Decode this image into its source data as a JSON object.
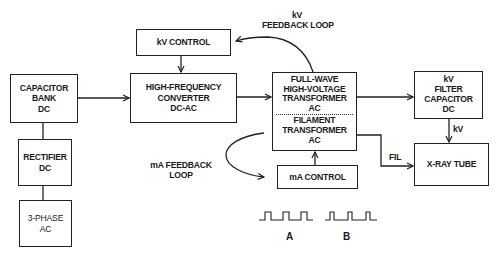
{
  "diagram": {
    "blocks": {
      "capacitor_bank": {
        "lines": [
          "CAPACITOR",
          "BANK",
          "DC"
        ]
      },
      "rectifier": {
        "lines": [
          "RECTIFIER",
          "DC"
        ]
      },
      "three_phase": {
        "lines": [
          "3-PHASE",
          "AC"
        ]
      },
      "kv_control": {
        "lines": [
          "kV CONTROL"
        ]
      },
      "hf_converter": {
        "lines": [
          "HIGH-FREQUENCY",
          "CONVERTER",
          "DC-AC"
        ]
      },
      "hv_transformer": {
        "lines": [
          "FULL-WAVE",
          "HIGH-VOLTAGE",
          "TRANSFORMER",
          "AC"
        ]
      },
      "filament_transformer": {
        "lines": [
          "FILAMENT",
          "TRANSFORMER",
          "AC"
        ]
      },
      "ma_control": {
        "lines": [
          "mA CONTROL"
        ]
      },
      "kv_filter_capacitor": {
        "lines": [
          "kV",
          "FILTER",
          "CAPACITOR",
          "DC"
        ]
      },
      "xray_tube": {
        "lines": [
          "X-RAY TUBE"
        ]
      }
    },
    "labels": {
      "kv_feedback": [
        "kV",
        "FEEDBACK LOOP"
      ],
      "ma_feedback": [
        "mA FEEDBACK",
        "LOOP"
      ],
      "kv_link": "kV",
      "fil_link": "FIL",
      "waveform_a": "A",
      "waveform_b": "B"
    },
    "connections": [
      {
        "from": "capacitor_bank",
        "to": "hf_converter",
        "type": "arrow"
      },
      {
        "from": "rectifier",
        "to": "capacitor_bank",
        "type": "line"
      },
      {
        "from": "three_phase",
        "to": "rectifier",
        "type": "line"
      },
      {
        "from": "kv_control",
        "to": "hf_converter",
        "type": "arrow"
      },
      {
        "from": "hf_converter",
        "to": "hv_transformer",
        "type": "arrow"
      },
      {
        "from": "hv_transformer",
        "to": "kv_filter_capacitor",
        "type": "arrow"
      },
      {
        "from": "kv_filter_capacitor",
        "to": "xray_tube",
        "type": "arrow",
        "label": "kV"
      },
      {
        "from": "filament_transformer",
        "to": "xray_tube",
        "type": "arrow",
        "label": "FIL"
      },
      {
        "from": "ma_control",
        "to": "filament_transformer",
        "type": "arrow"
      },
      {
        "from": "hv_transformer",
        "to": "kv_control",
        "type": "curved-arrow",
        "label": "kV FEEDBACK LOOP"
      },
      {
        "from": "filament_transformer",
        "to": "ma_control",
        "type": "curved-arrow",
        "label": "mA FEEDBACK LOOP"
      }
    ],
    "waveforms": [
      {
        "name": "A",
        "pulse_count": 3,
        "pulse_width": "wide"
      },
      {
        "name": "B",
        "pulse_count": 3,
        "pulse_width": "narrow"
      }
    ],
    "colors": {
      "ink": "#222222",
      "background": "#ffffff"
    }
  }
}
